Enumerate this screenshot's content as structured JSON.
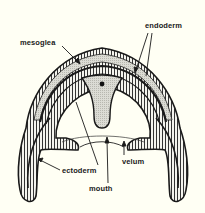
{
  "diagram": {
    "labels": {
      "mesoglea": "mesoglea",
      "endoderm": "endoderm",
      "ectoderm": "ectoderm",
      "mouth": "mouth",
      "velum": "velum"
    },
    "colors": {
      "background": "#fffff4",
      "outline": "#1a1a1a",
      "mesoglea_fill": "#d9d9d2",
      "cell_fill": "#f4f4ee"
    }
  }
}
